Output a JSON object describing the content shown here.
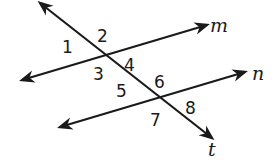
{
  "diagram": {
    "stroke_color": "#1a1a1a",
    "lines": [
      {
        "name": "m",
        "label": "m",
        "x1": 22,
        "y1": 80,
        "x2": 207,
        "y2": 25,
        "label_x": 210,
        "label_y": 32
      },
      {
        "name": "n",
        "label": "n",
        "x1": 60,
        "y1": 127,
        "x2": 245,
        "y2": 72,
        "label_x": 252,
        "label_y": 80
      },
      {
        "name": "t",
        "label": "t",
        "x1": 40,
        "y1": 3,
        "x2": 212,
        "y2": 138,
        "label_x": 208,
        "label_y": 156
      }
    ],
    "angles": [
      {
        "label": "1",
        "x": 62,
        "y": 53
      },
      {
        "label": "2",
        "x": 97,
        "y": 42
      },
      {
        "label": "3",
        "x": 93,
        "y": 80
      },
      {
        "label": "4",
        "x": 124,
        "y": 71
      },
      {
        "label": "5",
        "x": 116,
        "y": 97
      },
      {
        "label": "6",
        "x": 154,
        "y": 88
      },
      {
        "label": "7",
        "x": 150,
        "y": 126
      },
      {
        "label": "8",
        "x": 185,
        "y": 114
      }
    ]
  }
}
